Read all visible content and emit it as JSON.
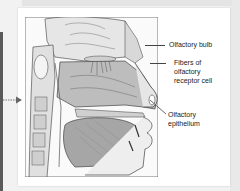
{
  "figure": {
    "labels": [
      {
        "id": "olfactory-bulb",
        "text": "Olfactory bulb"
      },
      {
        "id": "fibers",
        "line1": "Fibers of",
        "line2": "olfactory",
        "line3": "receptor cell"
      },
      {
        "id": "epithelium",
        "line1": "Olfactory",
        "line2": "epithelium"
      }
    ]
  },
  "colors": {
    "background": "#f2f2f2",
    "card": "#ffffff",
    "ink": "#222222",
    "left_bar": "#5a5a5a"
  }
}
